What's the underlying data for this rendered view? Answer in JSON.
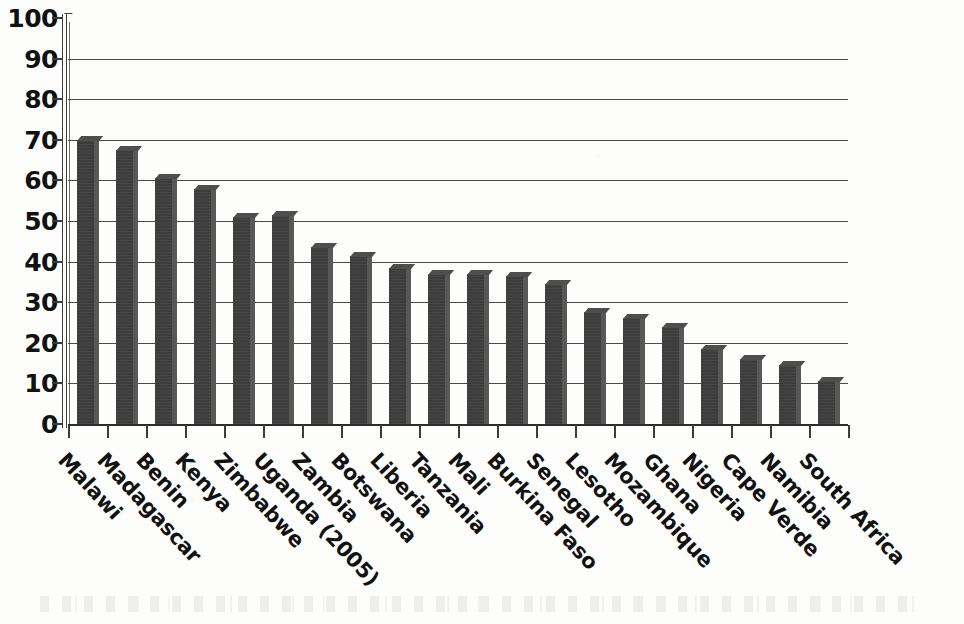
{
  "chart_data": {
    "type": "bar",
    "title": "",
    "subtitle": "",
    "xlabel": "",
    "ylabel": "",
    "ylim": [
      0,
      100
    ],
    "yticks": [
      0,
      10,
      20,
      30,
      40,
      50,
      60,
      70,
      80,
      90,
      100
    ],
    "grid": true,
    "legend": false,
    "orientation": "vertical",
    "bar_color": "#3d3d3d",
    "background_color": "#fdfdfc",
    "axis_color": "#3c3c3c",
    "label_rotation_deg": 47,
    "categories": [
      "Malawi",
      "Madagascar",
      "Benin",
      "Kenya",
      "Zimbabwe",
      "Uganda (2005)",
      "Zambia",
      "Botswana",
      "Liberia",
      "Tanzania",
      "Mali",
      "Burkina Faso",
      "Senegal",
      "Lesotho",
      "Mozambique",
      "Ghana",
      "Nigeria",
      "Cape Verde",
      "Namibia",
      "South Africa"
    ],
    "values": [
      70,
      67.5,
      60.5,
      58,
      51,
      51.5,
      43.5,
      41.5,
      38.5,
      37,
      37,
      36.5,
      34.5,
      27.5,
      26,
      24,
      18.5,
      16,
      14.5,
      10.5
    ],
    "series": [
      {
        "name": "",
        "values": [
          70,
          67.5,
          60.5,
          58,
          51,
          51.5,
          43.5,
          41.5,
          38.5,
          37,
          37,
          36.5,
          34.5,
          27.5,
          26,
          24,
          18.5,
          16,
          14.5,
          10.5
        ]
      }
    ]
  }
}
